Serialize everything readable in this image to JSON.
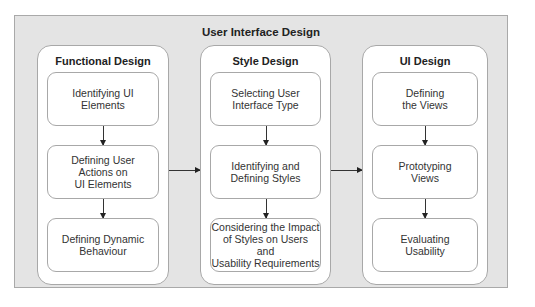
{
  "diagram": {
    "title": "User Interface Design",
    "columns": [
      {
        "title": "Functional Design",
        "steps": [
          {
            "label": "Identifying UI\nElements"
          },
          {
            "label": "Defining User\nActions on\nUI Elements"
          },
          {
            "label": "Defining Dynamic\nBehaviour"
          }
        ]
      },
      {
        "title": "Style Design",
        "steps": [
          {
            "label": "Selecting User\nInterface Type"
          },
          {
            "label": "Identifying and\nDefining Styles"
          },
          {
            "label": "Considering the Impact\nof Styles on Users\nand\nUsability Requirements"
          }
        ]
      },
      {
        "title": "UI Design",
        "steps": [
          {
            "label": "Defining\nthe Views"
          },
          {
            "label": "Prototyping\nViews"
          },
          {
            "label": "Evaluating\nUsability"
          }
        ]
      }
    ],
    "connections": [
      {
        "from": "Functional Design",
        "to": "Style Design"
      },
      {
        "from": "Style Design",
        "to": "UI Design"
      }
    ]
  }
}
